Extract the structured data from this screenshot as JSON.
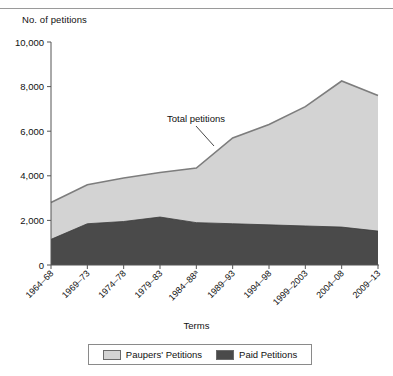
{
  "chart_data": {
    "type": "area",
    "title": "",
    "ylabel": "No. of petitions",
    "xlabel": "Terms",
    "categories": [
      "1964–68",
      "1969–73",
      "1974–78",
      "1979–83",
      "1984–88ᵃ",
      "1989–93",
      "1994–98",
      "1999–2003",
      "2004–08",
      "2009–13"
    ],
    "ytick_labels": [
      "0",
      "2,000",
      "4,000",
      "6,000",
      "8,000",
      "10,000"
    ],
    "ytick_values": [
      0,
      2000,
      4000,
      6000,
      8000,
      10000
    ],
    "ylim": [
      0,
      10000
    ],
    "grid": false,
    "stacked": true,
    "legend_position": "bottom",
    "annotations": [
      {
        "text": "Total petitions",
        "target_category": "1989–93"
      }
    ],
    "series": [
      {
        "name": "Paid Petitions",
        "color": "#4a4a4a",
        "values": [
          1150,
          1850,
          1950,
          2150,
          1900,
          1850,
          1800,
          1750,
          1700,
          1520
        ]
      },
      {
        "name": "Paupers' Petitions",
        "color": "#d3d3d3",
        "values": [
          1650,
          1750,
          1950,
          2000,
          2450,
          3850,
          4500,
          5350,
          6550,
          6080
        ]
      }
    ],
    "totals": [
      2800,
      3600,
      3900,
      4150,
      4350,
      5700,
      6300,
      7100,
      8250,
      7600
    ]
  },
  "legend": {
    "items": [
      {
        "label": "Paupers' Petitions",
        "color": "#d3d3d3"
      },
      {
        "label": "Paid Petitions",
        "color": "#4a4a4a"
      }
    ]
  },
  "axes": {
    "y_title": "No. of petitions",
    "x_title": "Terms"
  },
  "colors": {
    "paupers": "#d3d3d3",
    "paid": "#4a4a4a",
    "outline": "#7d7d7d",
    "axis": "#555555"
  }
}
